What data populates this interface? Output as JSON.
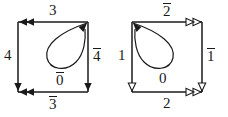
{
  "figure": {
    "kind": "two-directed-graph-diagrams",
    "stroke_color": "#1a1a1a",
    "background_color": "#ffffff",
    "left_graph": {
      "name": "left-square-diagram",
      "arrowhead_style": "filled",
      "square": {
        "x": 18,
        "y": 22,
        "size": 70
      },
      "loop": {
        "anchor": "top-right-corner",
        "direction": "counterclockwise"
      },
      "edges": [
        {
          "name": "top-edge",
          "label": "3",
          "overline": false,
          "arrow_direction": "left",
          "arrow_count": 2
        },
        {
          "name": "left-edge",
          "label": "4",
          "overline": false,
          "arrow_direction": "down",
          "arrow_count": 1
        },
        {
          "name": "right-edge",
          "label": "4",
          "overline": true,
          "arrow_direction": "down",
          "arrow_count": 1
        },
        {
          "name": "bottom-edge",
          "label": "3",
          "overline": true,
          "arrow_direction": "left",
          "arrow_count": 2
        },
        {
          "name": "loop-edge",
          "label": "0",
          "overline": true,
          "arrow_direction": "up-right",
          "arrow_count": 1
        }
      ],
      "labels": {
        "top": "3",
        "left": "4",
        "right": "4",
        "bottom": "3",
        "loop": "0"
      }
    },
    "right_graph": {
      "name": "right-square-diagram",
      "arrowhead_style": "hollow",
      "square": {
        "x": 132,
        "y": 22,
        "size": 70
      },
      "loop": {
        "anchor": "top-left-corner",
        "direction": "clockwise"
      },
      "edges": [
        {
          "name": "top-edge",
          "label": "2",
          "overline": true,
          "arrow_direction": "right",
          "arrow_count": 2
        },
        {
          "name": "left-edge",
          "label": "1",
          "overline": false,
          "arrow_direction": "down",
          "arrow_count": 1
        },
        {
          "name": "right-edge",
          "label": "1",
          "overline": true,
          "arrow_direction": "down",
          "arrow_count": 1
        },
        {
          "name": "bottom-edge",
          "label": "2",
          "overline": false,
          "arrow_direction": "right",
          "arrow_count": 2
        },
        {
          "name": "loop-edge",
          "label": "0",
          "overline": false,
          "arrow_direction": "up-left",
          "arrow_count": 1
        }
      ],
      "labels": {
        "top": "2",
        "left": "1",
        "right": "1",
        "bottom": "2",
        "loop": "0"
      }
    }
  }
}
